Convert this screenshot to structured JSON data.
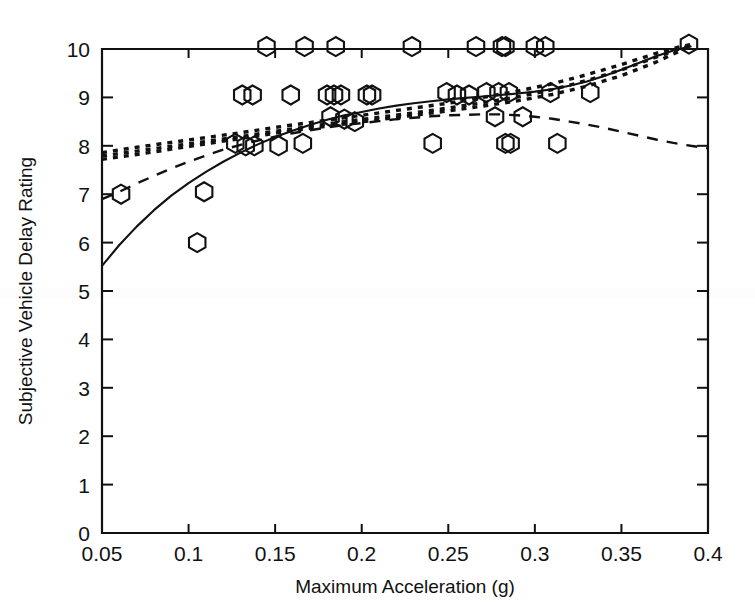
{
  "chart_data": {
    "type": "scatter",
    "title": "",
    "xlabel": "Maximum Acceleration (g)",
    "ylabel": "Subjective Vehicle Delay Rating",
    "xlim": [
      0.05,
      0.4
    ],
    "ylim": [
      0,
      10
    ],
    "xticks": [
      0.05,
      0.1,
      0.15,
      0.2,
      0.25,
      0.3,
      0.35,
      0.4
    ],
    "xticklabels": [
      "0.05",
      "0.1",
      "0.15",
      "0.2",
      "0.25",
      "0.3",
      "0.35",
      "0.4"
    ],
    "yticks": [
      0,
      1,
      2,
      3,
      4,
      5,
      6,
      7,
      8,
      9,
      10
    ],
    "yticklabels": [
      "0",
      "1",
      "2",
      "3",
      "4",
      "5",
      "6",
      "7",
      "8",
      "9",
      "10"
    ],
    "grid": false,
    "legend": "none",
    "marker": "hexagon-open",
    "series": [
      {
        "name": "Observed ratings",
        "type": "scatter",
        "marker": "hexagon-open",
        "points": [
          [
            0.061,
            7.0
          ],
          [
            0.105,
            6.0
          ],
          [
            0.109,
            7.05
          ],
          [
            0.127,
            8.05
          ],
          [
            0.131,
            9.05
          ],
          [
            0.133,
            8.0
          ],
          [
            0.137,
            9.05
          ],
          [
            0.138,
            8.0
          ],
          [
            0.145,
            10.05
          ],
          [
            0.152,
            8.0
          ],
          [
            0.159,
            9.05
          ],
          [
            0.166,
            8.05
          ],
          [
            0.167,
            10.05
          ],
          [
            0.18,
            9.05
          ],
          [
            0.182,
            8.6
          ],
          [
            0.184,
            9.05
          ],
          [
            0.185,
            10.05
          ],
          [
            0.188,
            9.05
          ],
          [
            0.19,
            8.55
          ],
          [
            0.196,
            8.5
          ],
          [
            0.203,
            9.05
          ],
          [
            0.206,
            9.05
          ],
          [
            0.229,
            10.05
          ],
          [
            0.241,
            8.05
          ],
          [
            0.249,
            9.1
          ],
          [
            0.255,
            9.05
          ],
          [
            0.262,
            9.05
          ],
          [
            0.266,
            10.05
          ],
          [
            0.272,
            9.1
          ],
          [
            0.277,
            8.6
          ],
          [
            0.279,
            9.1
          ],
          [
            0.281,
            10.05
          ],
          [
            0.283,
            10.05
          ],
          [
            0.283,
            8.05
          ],
          [
            0.285,
            9.1
          ],
          [
            0.286,
            8.05
          ],
          [
            0.293,
            8.6
          ],
          [
            0.3,
            10.05
          ],
          [
            0.306,
            10.05
          ],
          [
            0.309,
            9.1
          ],
          [
            0.313,
            8.05
          ],
          [
            0.332,
            9.1
          ],
          [
            0.389,
            10.1
          ]
        ]
      },
      {
        "name": "Fit curve (solid)",
        "type": "line",
        "style": "solid",
        "points": [
          [
            0.05,
            5.52
          ],
          [
            0.06,
            5.95
          ],
          [
            0.07,
            6.33
          ],
          [
            0.08,
            6.67
          ],
          [
            0.09,
            6.97
          ],
          [
            0.1,
            7.23
          ],
          [
            0.11,
            7.46
          ],
          [
            0.12,
            7.67
          ],
          [
            0.13,
            7.86
          ],
          [
            0.14,
            8.03
          ],
          [
            0.15,
            8.18
          ],
          [
            0.16,
            8.31
          ],
          [
            0.17,
            8.43
          ],
          [
            0.18,
            8.54
          ],
          [
            0.19,
            8.63
          ],
          [
            0.2,
            8.7
          ],
          [
            0.21,
            8.77
          ],
          [
            0.22,
            8.83
          ],
          [
            0.23,
            8.88
          ],
          [
            0.24,
            8.92
          ],
          [
            0.25,
            8.96
          ],
          [
            0.26,
            8.99
          ],
          [
            0.27,
            9.02
          ],
          [
            0.28,
            9.05
          ],
          [
            0.29,
            9.08
          ],
          [
            0.3,
            9.12
          ],
          [
            0.31,
            9.17
          ],
          [
            0.32,
            9.24
          ],
          [
            0.33,
            9.33
          ],
          [
            0.34,
            9.44
          ],
          [
            0.35,
            9.57
          ],
          [
            0.36,
            9.71
          ],
          [
            0.37,
            9.85
          ],
          [
            0.38,
            9.97
          ],
          [
            0.39,
            10.05
          ]
        ]
      },
      {
        "name": "Fit curve (dashed)",
        "type": "line",
        "style": "dashed",
        "points": [
          [
            0.05,
            6.9
          ],
          [
            0.06,
            7.05
          ],
          [
            0.07,
            7.22
          ],
          [
            0.08,
            7.38
          ],
          [
            0.09,
            7.53
          ],
          [
            0.1,
            7.67
          ],
          [
            0.11,
            7.8
          ],
          [
            0.12,
            7.92
          ],
          [
            0.13,
            8.02
          ],
          [
            0.14,
            8.11
          ],
          [
            0.15,
            8.19
          ],
          [
            0.16,
            8.26
          ],
          [
            0.17,
            8.32
          ],
          [
            0.18,
            8.38
          ],
          [
            0.19,
            8.43
          ],
          [
            0.2,
            8.47
          ],
          [
            0.21,
            8.51
          ],
          [
            0.22,
            8.55
          ],
          [
            0.23,
            8.58
          ],
          [
            0.24,
            8.61
          ],
          [
            0.25,
            8.63
          ],
          [
            0.26,
            8.64
          ],
          [
            0.27,
            8.65
          ],
          [
            0.28,
            8.65
          ],
          [
            0.29,
            8.63
          ],
          [
            0.3,
            8.6
          ],
          [
            0.31,
            8.56
          ],
          [
            0.32,
            8.5
          ],
          [
            0.33,
            8.44
          ],
          [
            0.34,
            8.37
          ],
          [
            0.35,
            8.29
          ],
          [
            0.36,
            8.21
          ],
          [
            0.37,
            8.13
          ],
          [
            0.38,
            8.06
          ],
          [
            0.39,
            8.0
          ],
          [
            0.4,
            7.95
          ]
        ]
      },
      {
        "name": "Fit curve (dotted 1)",
        "type": "line",
        "style": "dotted",
        "points": [
          [
            0.05,
            7.72
          ],
          [
            0.07,
            7.82
          ],
          [
            0.09,
            7.93
          ],
          [
            0.11,
            8.04
          ],
          [
            0.13,
            8.15
          ],
          [
            0.15,
            8.26
          ],
          [
            0.17,
            8.36
          ],
          [
            0.19,
            8.45
          ],
          [
            0.21,
            8.54
          ],
          [
            0.23,
            8.63
          ],
          [
            0.25,
            8.72
          ],
          [
            0.27,
            8.82
          ],
          [
            0.29,
            8.93
          ],
          [
            0.31,
            9.06
          ],
          [
            0.33,
            9.23
          ],
          [
            0.35,
            9.45
          ],
          [
            0.37,
            9.73
          ],
          [
            0.385,
            9.98
          ],
          [
            0.39,
            10.05
          ]
        ]
      },
      {
        "name": "Fit curve (dotted 2)",
        "type": "line",
        "style": "dotted",
        "points": [
          [
            0.05,
            7.79
          ],
          [
            0.07,
            7.89
          ],
          [
            0.09,
            7.99
          ],
          [
            0.11,
            8.09
          ],
          [
            0.13,
            8.19
          ],
          [
            0.15,
            8.3
          ],
          [
            0.17,
            8.4
          ],
          [
            0.19,
            8.5
          ],
          [
            0.21,
            8.59
          ],
          [
            0.23,
            8.68
          ],
          [
            0.25,
            8.78
          ],
          [
            0.27,
            8.89
          ],
          [
            0.29,
            9.01
          ],
          [
            0.31,
            9.16
          ],
          [
            0.33,
            9.35
          ],
          [
            0.35,
            9.57
          ],
          [
            0.37,
            9.83
          ],
          [
            0.385,
            10.02
          ],
          [
            0.39,
            10.07
          ]
        ]
      },
      {
        "name": "Fit curve (dotted 3)",
        "type": "line",
        "style": "dotted",
        "points": [
          [
            0.05,
            7.86
          ],
          [
            0.07,
            7.97
          ],
          [
            0.09,
            8.07
          ],
          [
            0.11,
            8.17
          ],
          [
            0.13,
            8.27
          ],
          [
            0.15,
            8.38
          ],
          [
            0.17,
            8.48
          ],
          [
            0.19,
            8.58
          ],
          [
            0.21,
            8.68
          ],
          [
            0.23,
            8.78
          ],
          [
            0.25,
            8.88
          ],
          [
            0.27,
            9.0
          ],
          [
            0.29,
            9.13
          ],
          [
            0.31,
            9.28
          ],
          [
            0.33,
            9.47
          ],
          [
            0.35,
            9.68
          ],
          [
            0.37,
            9.91
          ],
          [
            0.385,
            10.06
          ],
          [
            0.39,
            10.09
          ]
        ]
      }
    ]
  }
}
